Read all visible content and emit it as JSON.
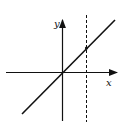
{
  "diagram": {
    "type": "function-graph",
    "axes": {
      "x_label": "x",
      "y_label": "y"
    },
    "line": {
      "description": "straight line through the origin with positive slope",
      "equation": "y = x"
    },
    "vertical_line": {
      "style": "dashed",
      "position": "x = a (a > 0)"
    },
    "marked_point": {
      "description": "intersection of the line with the dashed vertical line"
    },
    "colors": {
      "stroke": "#111111",
      "background": "#ffffff"
    }
  }
}
